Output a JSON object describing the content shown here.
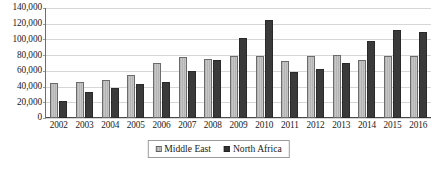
{
  "chart_data": {
    "type": "bar",
    "title": "",
    "subtitle": "",
    "xlabel": "",
    "ylabel": "",
    "categories": [
      "2002",
      "2003",
      "2004",
      "2005",
      "2006",
      "2007",
      "2008",
      "2009",
      "2010",
      "2011",
      "2012",
      "2013",
      "2014",
      "2015",
      "2016"
    ],
    "series": [
      {
        "name": "Middle East",
        "color": "#c0c0c0",
        "values": [
          45000,
          46000,
          48000,
          55000,
          70000,
          78000,
          75000,
          79000,
          79000,
          73000,
          79000,
          80000,
          74000,
          79000,
          79000
        ]
      },
      {
        "name": "North Africa",
        "color": "#3a3a3a",
        "values": [
          22000,
          33000,
          38000,
          43000,
          46000,
          60000,
          74000,
          102000,
          125000,
          58000,
          62000,
          70000,
          98000,
          112000,
          110000
        ]
      }
    ],
    "ylim": [
      0,
      140000
    ],
    "yticks": [
      0,
      20000,
      40000,
      60000,
      80000,
      100000,
      120000,
      140000
    ],
    "ytick_labels": [
      "0",
      "20,000",
      "40,000",
      "60,000",
      "80,000",
      "100,000",
      "120,000",
      "140,000"
    ],
    "grid": true,
    "grid_axis": "y",
    "legend_position": "bottom",
    "legend_entries": [
      "Middle East",
      "North Africa"
    ]
  }
}
